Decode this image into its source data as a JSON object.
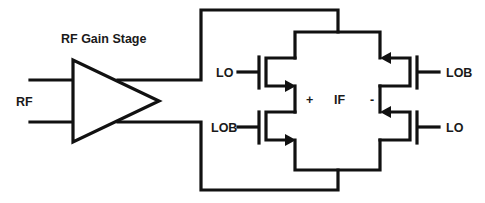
{
  "diagram": {
    "title": "RF Gain Stage",
    "input_label": "RF",
    "left_upper_gate_label": "LO",
    "left_lower_gate_label": "LOB",
    "right_upper_gate_label": "LOB",
    "right_lower_gate_label": "LO",
    "output_label": "IF",
    "output_plus": "+",
    "output_minus": "-",
    "colors": {
      "line": "#111111",
      "background": "#ffffff",
      "text": "#1a1a1a"
    }
  }
}
